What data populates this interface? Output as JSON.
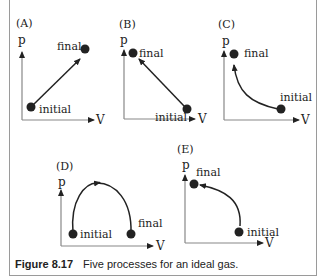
{
  "figure": {
    "caption_number": "Figure 8.17",
    "caption_text": "Five processes for an ideal gas.",
    "axis_y_label": "p",
    "axis_x_label": "V",
    "colors": {
      "axis": "#888888",
      "curve": "#222222",
      "point": "#222222",
      "border": "#9a9a9a"
    }
  },
  "panels": [
    {
      "id": "A",
      "label": "(A)",
      "initial": "initial",
      "final": "final",
      "shape": "straight line up-right"
    },
    {
      "id": "B",
      "label": "(B)",
      "initial": "initial",
      "final": "final",
      "shape": "straight line up-left"
    },
    {
      "id": "C",
      "label": "(C)",
      "initial": "initial",
      "final": "final",
      "shape": "concave curve up-left"
    },
    {
      "id": "D",
      "label": "(D)",
      "initial": "initial",
      "final": "final",
      "shape": "arch left to right"
    },
    {
      "id": "E",
      "label": "(E)",
      "initial": "initial",
      "final": "final",
      "shape": "convex curve up-left"
    }
  ]
}
